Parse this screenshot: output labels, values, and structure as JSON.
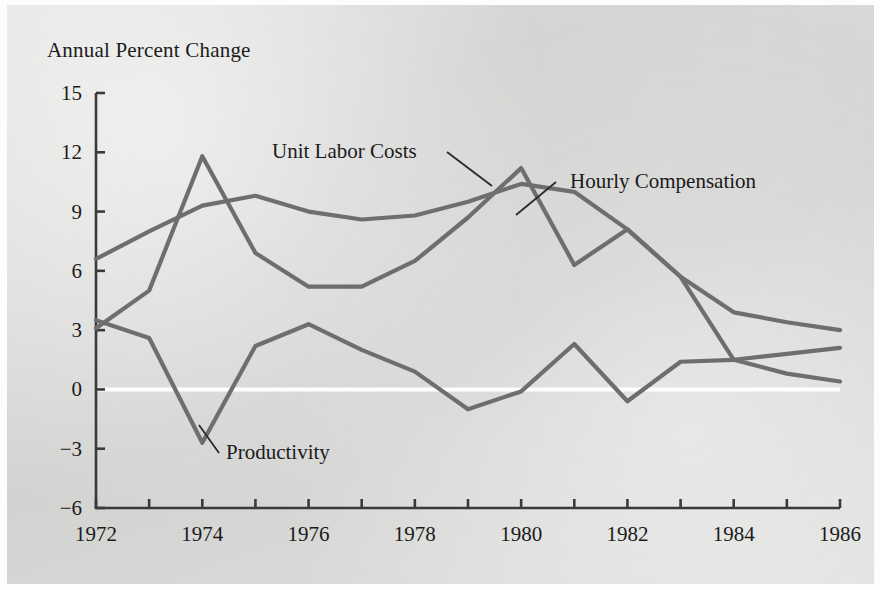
{
  "figure": {
    "background_color": "#d9d9d7",
    "title": "Annual Percent Change"
  },
  "chart_data": {
    "type": "line",
    "title": "Annual Percent Change",
    "xlabel": "",
    "ylabel": "Annual Percent Change",
    "xlim": [
      1972,
      1986
    ],
    "ylim": [
      -6,
      15
    ],
    "yticks": [
      15,
      12,
      9,
      6,
      3,
      0,
      -3,
      -6
    ],
    "ytick_labels": [
      "15",
      "12",
      "9",
      "6",
      "3",
      "0",
      "−3",
      "−6"
    ],
    "xticks": [
      1972,
      1973,
      1974,
      1975,
      1976,
      1977,
      1978,
      1979,
      1980,
      1981,
      1982,
      1983,
      1984,
      1985,
      1986
    ],
    "xtick_labels": [
      "1972",
      "",
      "1974",
      "",
      "1976",
      "",
      "1978",
      "",
      "1980",
      "",
      "1982",
      "",
      "1984",
      "",
      "1986"
    ],
    "xtick_labels_shown": [
      "1972",
      "1974",
      "1976",
      "1978",
      "1980",
      "1982",
      "1984",
      "1986"
    ],
    "grid": false,
    "zero_line": true,
    "zero_line_color": "#ffffff",
    "legend_position": "inline-annotations",
    "x": [
      1972,
      1973,
      1974,
      1975,
      1976,
      1977,
      1978,
      1979,
      1980,
      1981,
      1982,
      1983,
      1984,
      1985,
      1986
    ],
    "series": [
      {
        "name": "Hourly Compensation",
        "color": "#6e6e6e",
        "values": [
          6.6,
          8.0,
          9.3,
          9.8,
          9.0,
          8.6,
          8.8,
          9.5,
          10.4,
          10.0,
          8.1,
          5.7,
          3.9,
          3.4,
          3.0
        ]
      },
      {
        "name": "Unit Labor Costs",
        "color": "#6e6e6e",
        "values": [
          3.1,
          5.0,
          11.8,
          6.9,
          5.2,
          5.2,
          6.5,
          8.7,
          11.2,
          6.3,
          8.1,
          5.7,
          1.5,
          1.8,
          2.1
        ]
      },
      {
        "name": "Productivity",
        "color": "#6e6e6e",
        "values": [
          3.5,
          2.6,
          -2.7,
          2.2,
          3.3,
          2.0,
          0.9,
          -1.0,
          -0.1,
          2.3,
          -0.6,
          1.4,
          1.5,
          0.8,
          0.4
        ]
      }
    ],
    "annotations": [
      {
        "text": "Unit Labor Costs",
        "series": "Unit Labor Costs"
      },
      {
        "text": "Hourly Compensation",
        "series": "Hourly Compensation"
      },
      {
        "text": "Productivity",
        "series": "Productivity"
      }
    ]
  },
  "axes": {
    "y_axis_name": "y-axis",
    "x_axis_name": "x-axis"
  }
}
